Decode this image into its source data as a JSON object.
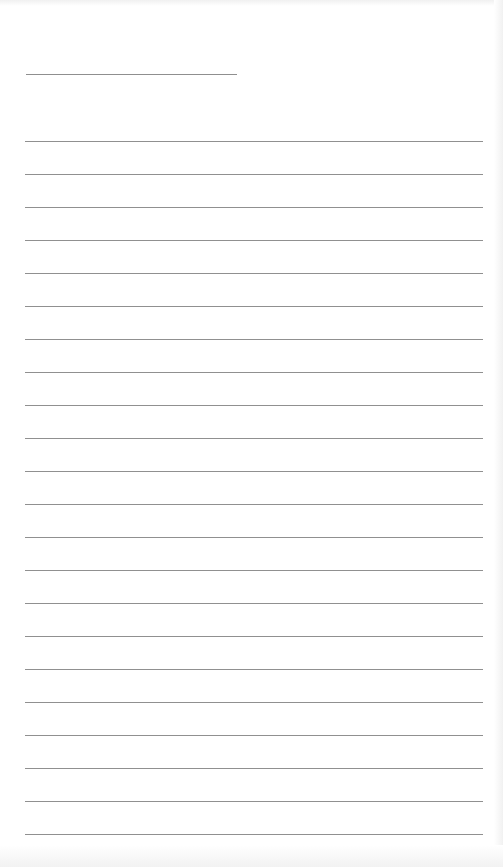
{
  "page": {
    "type": "lined-notepad",
    "title_line": {
      "present": true,
      "text": ""
    },
    "rule_count": 22,
    "rule_spacing_px": 33,
    "first_rule_y": 141,
    "lines": [
      "",
      "",
      "",
      "",
      "",
      "",
      "",
      "",
      "",
      "",
      "",
      "",
      "",
      "",
      "",
      "",
      "",
      "",
      "",
      "",
      "",
      ""
    ],
    "colors": {
      "paper": "#ffffff",
      "rule": "#909090"
    }
  }
}
